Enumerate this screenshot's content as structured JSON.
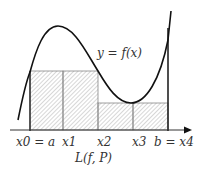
{
  "diagram": {
    "curve_label": "y = f(x)",
    "sum_label": "L(f, P)",
    "tick_labels": [
      {
        "id": "x0",
        "text": "x0 = a"
      },
      {
        "id": "x1",
        "text": "x1"
      },
      {
        "id": "x2",
        "text": "x2"
      },
      {
        "id": "x3",
        "text": "x3"
      },
      {
        "id": "x4",
        "text": "b = x4"
      }
    ],
    "partition_points_px": [
      30,
      63,
      98,
      133,
      168
    ],
    "rectangles": [
      {
        "from": "x0",
        "to": "x1",
        "height_level": "high"
      },
      {
        "from": "x1",
        "to": "x2",
        "height_level": "high"
      },
      {
        "from": "x2",
        "to": "x3",
        "height_level": "low"
      },
      {
        "from": "x3",
        "to": "x4",
        "height_level": "low"
      }
    ],
    "colors": {
      "curve": "#111111",
      "hatch": "#888888",
      "axis": "#333333"
    }
  }
}
